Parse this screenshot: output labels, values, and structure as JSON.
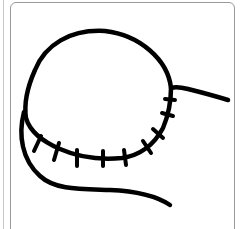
{
  "figure": {
    "stroke_color": "#000000",
    "background_color": "#ffffff",
    "frame_color": "#9a9a9a",
    "stitch_count": 9
  }
}
